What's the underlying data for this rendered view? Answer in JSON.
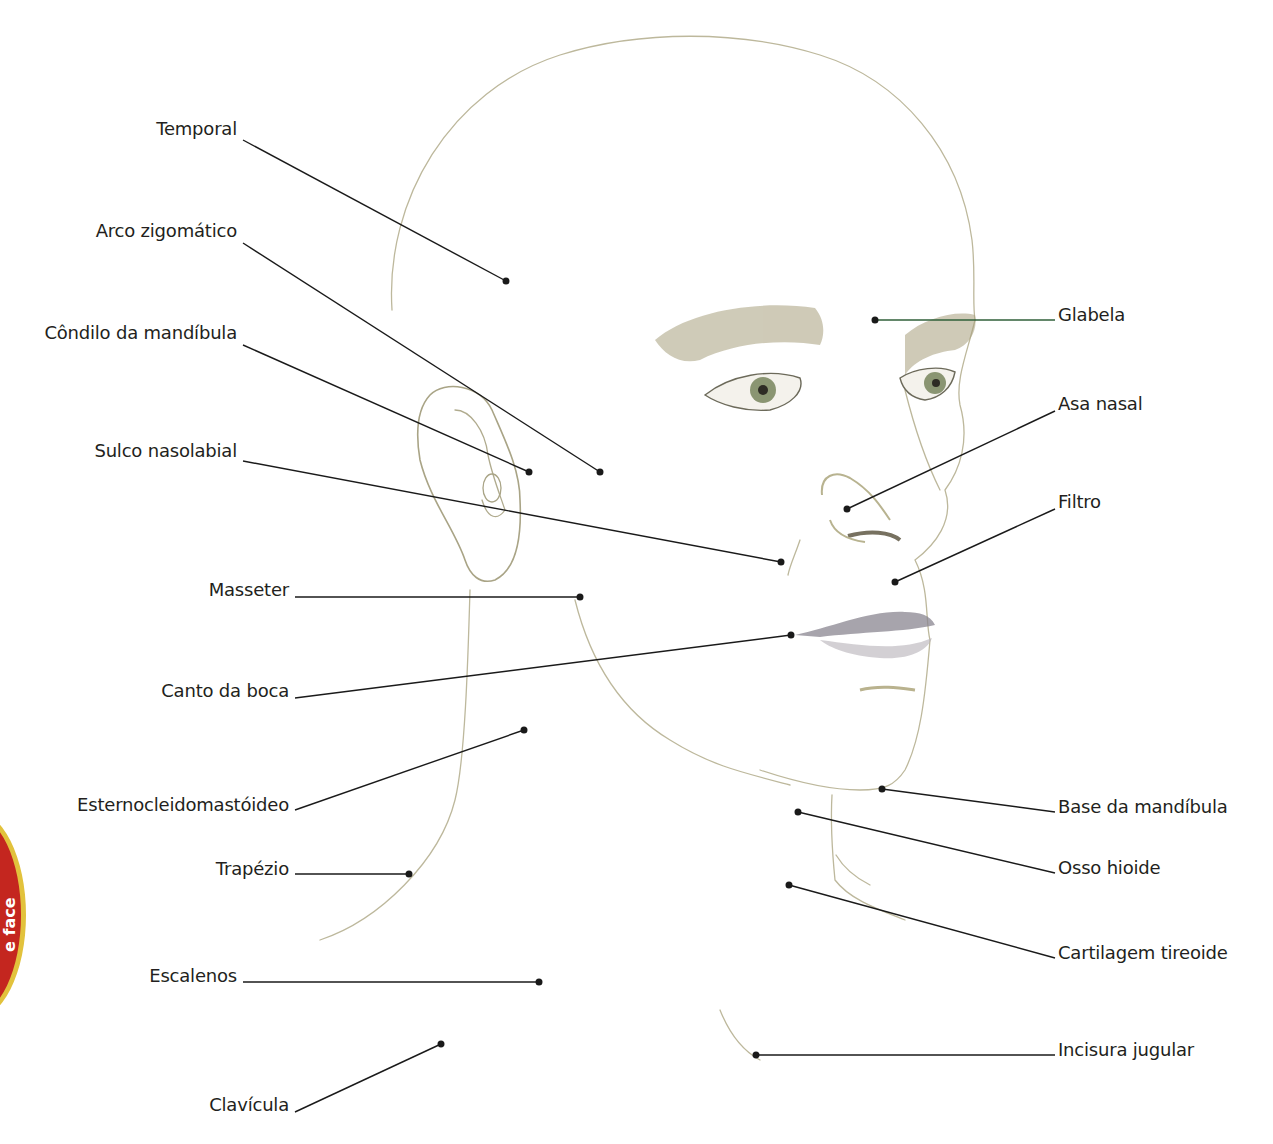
{
  "badge": {
    "text": "e face",
    "color": "#c4261f",
    "border_color": "#e2c23c"
  },
  "labels": {
    "left": [
      {
        "text": "Temporal",
        "x": 237,
        "y": 129
      },
      {
        "text": "Arco zigomático",
        "x": 237,
        "y": 231
      },
      {
        "text": "Côndilo da mandíbula",
        "x": 237,
        "y": 333
      },
      {
        "text": "Sulco nasolabial",
        "x": 237,
        "y": 451
      },
      {
        "text": "Masseter",
        "x": 289,
        "y": 590
      },
      {
        "text": "Canto da boca",
        "x": 289,
        "y": 691
      },
      {
        "text": "Esternocleidomastóideo",
        "x": 289,
        "y": 805
      },
      {
        "text": "Trapézio",
        "x": 289,
        "y": 869
      },
      {
        "text": "Escalenos",
        "x": 237,
        "y": 976
      },
      {
        "text": "Clavícula",
        "x": 289,
        "y": 1105
      }
    ],
    "right": [
      {
        "text": "Glabela",
        "x": 1058,
        "y": 315
      },
      {
        "text": "Asa nasal",
        "x": 1058,
        "y": 404
      },
      {
        "text": "Filtro",
        "x": 1058,
        "y": 502
      },
      {
        "text": "Base da mandíbula",
        "x": 1058,
        "y": 807
      },
      {
        "text": "Osso hioide",
        "x": 1058,
        "y": 868
      },
      {
        "text": "Cartilagem tireoide",
        "x": 1058,
        "y": 953
      },
      {
        "text": "Incisura jugular",
        "x": 1058,
        "y": 1050
      }
    ]
  },
  "leaders": [
    {
      "name": "temporal",
      "x1": 243,
      "y1": 140,
      "x2": 506,
      "y2": 281
    },
    {
      "name": "arco-zigomatico",
      "x1": 243,
      "y1": 243,
      "x2": 600,
      "y2": 472
    },
    {
      "name": "condilo-da-mandibula",
      "x1": 243,
      "y1": 345,
      "x2": 529,
      "y2": 472
    },
    {
      "name": "sulco-nasolabial",
      "x1": 243,
      "y1": 461,
      "x2": 781,
      "y2": 562
    },
    {
      "name": "masseter",
      "x1": 295,
      "y1": 597,
      "x2": 580,
      "y2": 597
    },
    {
      "name": "canto-da-boca",
      "x1": 295,
      "y1": 698,
      "x2": 791,
      "y2": 635
    },
    {
      "name": "esternocleidomastoideo",
      "x1": 295,
      "y1": 810,
      "x2": 524,
      "y2": 730
    },
    {
      "name": "trapezio",
      "x1": 295,
      "y1": 874,
      "x2": 409,
      "y2": 874
    },
    {
      "name": "escalenos",
      "x1": 243,
      "y1": 982,
      "x2": 539,
      "y2": 982
    },
    {
      "name": "clavicula",
      "x1": 295,
      "y1": 1112,
      "x2": 441,
      "y2": 1044
    },
    {
      "name": "glabela",
      "x1": 875,
      "y1": 320,
      "x2": 1055,
      "y2": 320
    },
    {
      "name": "asa-nasal",
      "x1": 847,
      "y1": 509,
      "x2": 1055,
      "y2": 411
    },
    {
      "name": "filtro",
      "x1": 895,
      "y1": 582,
      "x2": 1055,
      "y2": 509
    },
    {
      "name": "base-da-mandibula",
      "x1": 882,
      "y1": 789,
      "x2": 1055,
      "y2": 812
    },
    {
      "name": "osso-hioide",
      "x1": 798,
      "y1": 812,
      "x2": 1055,
      "y2": 873
    },
    {
      "name": "cartilagem-tireoide",
      "x1": 789,
      "y1": 885,
      "x2": 1055,
      "y2": 958
    },
    {
      "name": "incisura-jugular",
      "x1": 756,
      "y1": 1055,
      "x2": 1055,
      "y2": 1055
    }
  ],
  "colors": {
    "line": "#1a1a1a",
    "glabela_line": "#2f5f38",
    "sketch": "#b8b49a",
    "shade": "#9a9270",
    "iris": "#7d8a6a",
    "lip": "#8c8690"
  }
}
